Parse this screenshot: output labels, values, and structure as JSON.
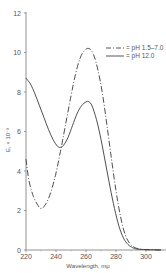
{
  "chart_data": {
    "type": "line",
    "title": "",
    "xlabel": "Wavelength, mμ",
    "ylabel": "E, × 10⁻³",
    "xlim": [
      220,
      310
    ],
    "ylim": [
      0,
      12
    ],
    "xticks": [
      220,
      240,
      260,
      280,
      300
    ],
    "yticks": [
      0,
      2,
      4,
      6,
      8,
      10,
      12
    ],
    "grid": false,
    "legend_position": "top-right",
    "series": [
      {
        "name": "= pH 1.5–7.0",
        "style": "dash-dot",
        "x": [
          220,
          222,
          225,
          228,
          230,
          232,
          235,
          238,
          240,
          243,
          246,
          250,
          253,
          256,
          259,
          262,
          265,
          268,
          271,
          274,
          277,
          280,
          283,
          286,
          289,
          292,
          295,
          300,
          305,
          310
        ],
        "y": [
          4.6,
          3.5,
          2.7,
          2.25,
          2.1,
          2.2,
          2.6,
          3.3,
          3.9,
          5.0,
          6.2,
          7.8,
          8.9,
          9.7,
          10.1,
          10.2,
          9.9,
          9.1,
          7.9,
          6.3,
          4.6,
          3.0,
          1.7,
          0.8,
          0.35,
          0.15,
          0.06,
          0.02,
          0.01,
          0.0
        ]
      },
      {
        "name": "= pH 12.0",
        "style": "solid",
        "x": [
          220,
          223,
          226,
          229,
          232,
          235,
          238,
          241,
          243,
          245,
          248,
          251,
          254,
          257,
          260,
          262,
          264,
          267,
          270,
          273,
          276,
          279,
          282,
          285,
          288,
          291,
          294,
          300,
          305,
          310
        ],
        "y": [
          8.7,
          8.4,
          7.9,
          7.3,
          6.7,
          6.1,
          5.6,
          5.25,
          5.2,
          5.3,
          5.7,
          6.3,
          6.9,
          7.3,
          7.5,
          7.5,
          7.3,
          6.6,
          5.6,
          4.4,
          3.2,
          2.1,
          1.2,
          0.6,
          0.28,
          0.12,
          0.05,
          0.02,
          0.01,
          0.0
        ]
      }
    ]
  }
}
